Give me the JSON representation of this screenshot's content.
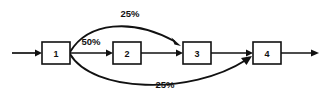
{
  "diagram": {
    "background_color": "#ffffff",
    "stroke_color": "#111111",
    "nodes": [
      {
        "id": "node-1",
        "label": "1",
        "x": 42,
        "y": 42,
        "w": 28,
        "h": 22
      },
      {
        "id": "node-2",
        "label": "2",
        "x": 113,
        "y": 42,
        "w": 28,
        "h": 22
      },
      {
        "id": "node-3",
        "label": "3",
        "x": 183,
        "y": 42,
        "w": 28,
        "h": 22
      },
      {
        "id": "node-4",
        "label": "4",
        "x": 253,
        "y": 42,
        "w": 28,
        "h": 22
      }
    ],
    "edges": [
      {
        "id": "edge-in",
        "from": "input",
        "to": "node-1",
        "label": "",
        "kind": "straight"
      },
      {
        "id": "edge-1-2",
        "from": "node-1",
        "to": "node-2",
        "label": "50%",
        "kind": "straight"
      },
      {
        "id": "edge-2-3",
        "from": "node-2",
        "to": "node-3",
        "label": "",
        "kind": "straight"
      },
      {
        "id": "edge-1-3",
        "from": "node-1",
        "to": "node-3",
        "label": "25%",
        "kind": "curve-top"
      },
      {
        "id": "edge-3-4",
        "from": "node-3",
        "to": "node-4",
        "label": "",
        "kind": "straight"
      },
      {
        "id": "edge-1-4",
        "from": "node-1",
        "to": "node-4",
        "label": "25%",
        "kind": "curve-bottom"
      },
      {
        "id": "edge-out",
        "from": "node-4",
        "to": "output",
        "label": "",
        "kind": "straight"
      }
    ],
    "labels": {
      "top_percent": "25%",
      "middle_percent": "50%",
      "bottom_percent": "25%"
    }
  }
}
